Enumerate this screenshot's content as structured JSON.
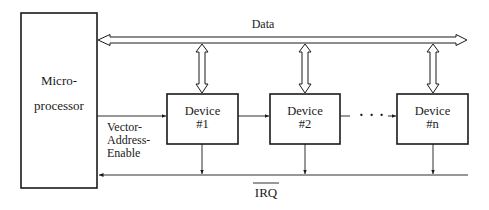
{
  "diagram": {
    "processor": {
      "line1": "Micro-",
      "line2": "processor"
    },
    "data_bus_label": "Data",
    "vae_label": {
      "line1": "Vector-",
      "line2": "Address-",
      "line3": "Enable"
    },
    "irq_label": "IRQ",
    "devices": [
      {
        "line1": "Device",
        "line2": "#1"
      },
      {
        "line1": "Device",
        "line2": "#2"
      },
      {
        "line1": "Device",
        "line2": "#n"
      }
    ],
    "ellipsis": "· · ·",
    "colors": {
      "stroke": "#1a1a1a",
      "background": "#ffffff"
    }
  }
}
